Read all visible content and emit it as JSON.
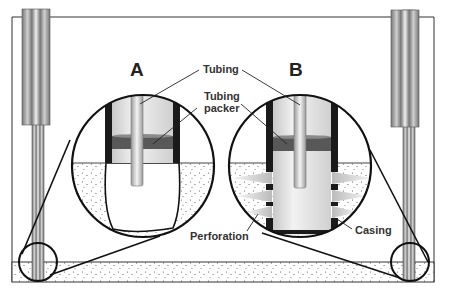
{
  "diagram": {
    "panels": [
      {
        "id": "A",
        "label": "A",
        "description": "Open-hole completion"
      },
      {
        "id": "B",
        "label": "B",
        "description": "Cased and perforated completion"
      }
    ],
    "labels": {
      "tubing": "Tubing",
      "tubing_packer_line1": "Tubing",
      "tubing_packer_line2": "packer",
      "perforation": "Perforation",
      "casing": "Casing"
    },
    "colors": {
      "outline": "#222222",
      "packer": "#555555",
      "tube_light": "#e8e8e8",
      "tube_mid": "#bdbdbd",
      "formation_dots": "#555555",
      "background": "#ffffff"
    }
  }
}
